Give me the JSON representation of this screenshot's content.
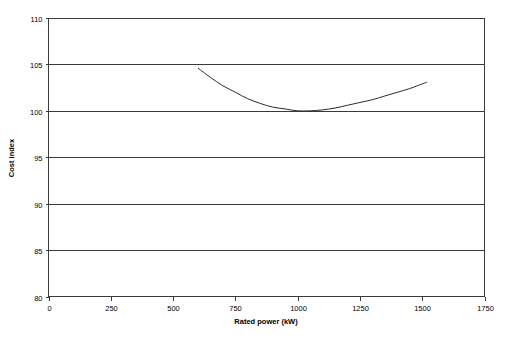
{
  "chart_data": {
    "type": "line",
    "title": "",
    "subtitle": "",
    "xlabel": "Rated power (kW)",
    "ylabel": "Cost index",
    "xlim": [
      0,
      1750
    ],
    "ylim": [
      80,
      110
    ],
    "xticks": [
      0,
      250,
      500,
      750,
      1000,
      1250,
      1500,
      1750
    ],
    "yticks": [
      80,
      85,
      90,
      95,
      100,
      105,
      110
    ],
    "xtick_labels": [
      "0",
      "250",
      "500",
      "750",
      "1000",
      "1250",
      "1500",
      "1750"
    ],
    "ytick_labels": [
      "80",
      "85",
      "90",
      "95",
      "100",
      "105",
      "110"
    ],
    "grid": "horizontal",
    "legend": "none",
    "annotations": [],
    "series": [
      {
        "name": "Cost index",
        "color": "#2b2b2b",
        "x": [
          600,
          650,
          700,
          750,
          800,
          850,
          900,
          950,
          1000,
          1050,
          1100,
          1150,
          1200,
          1250,
          1300,
          1350,
          1400,
          1450,
          1500,
          1520
        ],
        "y": [
          104.6,
          103.6,
          102.7,
          102.0,
          101.3,
          100.8,
          100.4,
          100.2,
          100.0,
          100.0,
          100.1,
          100.3,
          100.6,
          100.9,
          101.2,
          101.6,
          102.0,
          102.4,
          102.9,
          103.1
        ]
      }
    ]
  },
  "axes": {
    "x_title": "Rated power (kW)",
    "y_title": "Cost index"
  }
}
